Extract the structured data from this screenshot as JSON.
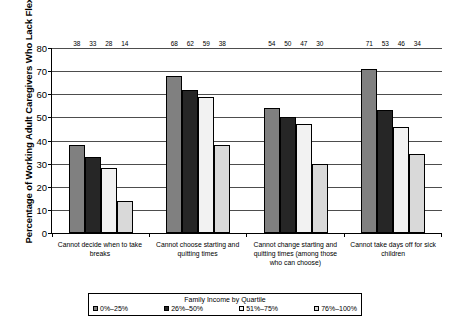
{
  "chart_data": {
    "type": "bar",
    "title": "",
    "xlabel": "",
    "ylabel": "Percentage of Working Adult Caregivers Who Lack Flexibility",
    "ylim": [
      0,
      80
    ],
    "yticks": [
      0,
      10,
      20,
      30,
      40,
      50,
      60,
      70,
      80
    ],
    "grid": true,
    "legend_position": "bottom",
    "legend_title": "Family Income by Quartile",
    "categories": [
      "Cannot decide when to take breaks",
      "Cannot choose starting and quitting times",
      "Cannot change starting and quitting times (among those who can choose)",
      "Cannot take days off for sick children"
    ],
    "series": [
      {
        "name": "0%–25%",
        "color": "#808080",
        "values": [
          38,
          68,
          54,
          71
        ]
      },
      {
        "name": "26%–50%",
        "color": "#262626",
        "values": [
          33,
          62,
          50,
          53
        ]
      },
      {
        "name": "51%–75%",
        "color": "#f2f2f2",
        "values": [
          28,
          59,
          47,
          46
        ]
      },
      {
        "name": "76%–100%",
        "color": "#d9d9d9",
        "values": [
          14,
          38,
          30,
          34
        ]
      }
    ]
  },
  "axis": {
    "y_title": "Percentage of Working Adult Caregivers Who Lack Flexibility",
    "y_ticks": [
      "0",
      "10",
      "20",
      "30",
      "40",
      "50",
      "60",
      "70",
      "80"
    ]
  },
  "legend": {
    "title": "Family Income by Quartile",
    "items": [
      {
        "label": "0%–25%"
      },
      {
        "label": "26%–50%"
      },
      {
        "label": "51%–75%"
      },
      {
        "label": "76%–100%"
      }
    ]
  },
  "categories": [
    {
      "label": "Cannot decide when to take breaks"
    },
    {
      "label": "Cannot choose starting and quitting times"
    },
    {
      "label": "Cannot change starting and quitting times (among those who can choose)"
    },
    {
      "label": "Cannot take days off for sick children"
    }
  ],
  "values": {
    "g0": [
      "38",
      "33",
      "28",
      "14"
    ],
    "g1": [
      "68",
      "62",
      "59",
      "38"
    ],
    "g2": [
      "54",
      "50",
      "47",
      "30"
    ],
    "g3": [
      "71",
      "53",
      "46",
      "34"
    ]
  }
}
